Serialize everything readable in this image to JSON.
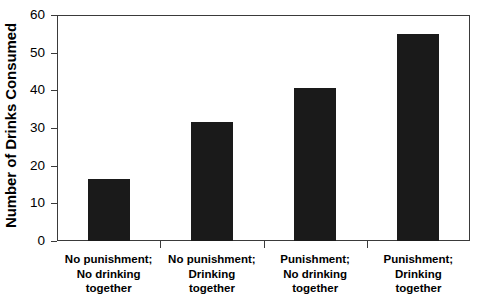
{
  "chart_data": {
    "type": "bar",
    "title": "",
    "xlabel": "",
    "ylabel": "Number of Drinks Consumed",
    "ylim": [
      0,
      60
    ],
    "yticks": [
      0,
      10,
      20,
      30,
      40,
      50,
      60
    ],
    "grid": false,
    "legend": null,
    "bar_color": "#1a1a1a",
    "axis_color": "#3a3a3a",
    "categories": [
      "No punishment; No drinking together",
      "No punishment; Drinking together",
      "Punishment; No drinking together",
      "Punishment; Drinking together"
    ],
    "category_lines": [
      [
        "No punishment;",
        "No drinking",
        "together"
      ],
      [
        "No punishment;",
        "Drinking",
        "together"
      ],
      [
        "Punishment;",
        "No drinking",
        "together"
      ],
      [
        "Punishment;",
        "Drinking",
        "together"
      ]
    ],
    "values": [
      16.4,
      31.6,
      40.6,
      54.9
    ]
  }
}
